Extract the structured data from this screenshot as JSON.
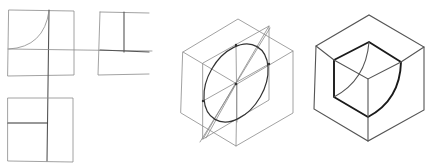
{
  "figure": {
    "description": "Hand-drawn technical sketch: orthographic views and isometric construction of a cube with a quarter-sphere cutout",
    "panels": [
      {
        "id": "orthographic-views",
        "label": "Orthographic projection (front, side, top views)"
      },
      {
        "id": "isometric-construction",
        "label": "Isometric construction cube with ellipse"
      },
      {
        "id": "isometric-result",
        "label": "Finished isometric cube with spherical corner cutout"
      }
    ],
    "colors": {
      "background": "#ffffff",
      "construction_line": "#8a8a8a",
      "outline": "#555555",
      "bold_line": "#1a1a1a"
    }
  }
}
